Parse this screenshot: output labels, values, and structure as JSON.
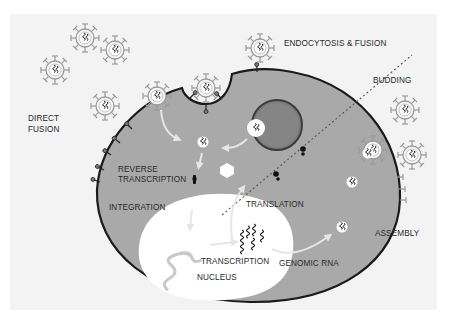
{
  "figure": {
    "colors": {
      "background": "#ffffff",
      "panel": "#f3f3f3",
      "cytoplasm": "#a9a9a9",
      "membrane": "#1a1a1a",
      "nucleus": "#ffffff",
      "endosome": "#6f6f6f",
      "virion_outline": "#9a9a9a",
      "arrow": "#e6e6e6",
      "divider": "#555555"
    },
    "labels": {
      "endocytosis_fusion": "ENDOCYTOSIS & FUSION",
      "budding": "BUDDING",
      "direct_fusion_line1": "DIRECT",
      "direct_fusion_line2": "FUSION",
      "reverse_transcription_line1": "REVERSE",
      "reverse_transcription_line2": "TRANSCRIPTION",
      "integration": "INTEGRATION",
      "translation": "TRANSLATION",
      "transcription": "TRANSCRIPTION",
      "nucleus": "NUCLEUS",
      "genomic_rna": "GENOMIC RNA",
      "assembly": "ASSEMBLY"
    },
    "regions": {
      "left_half": "entry",
      "right_half": "exit"
    }
  }
}
